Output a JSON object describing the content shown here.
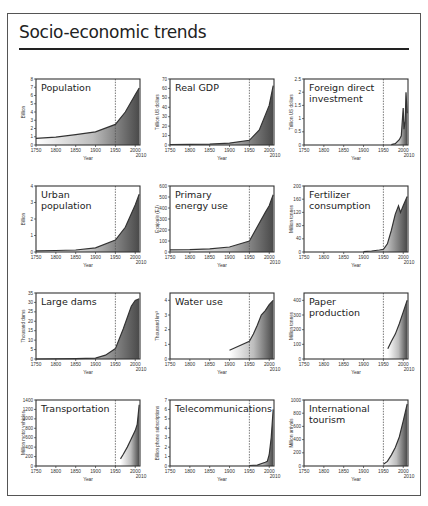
{
  "page": {
    "title": "Socio-economic trends",
    "xlabel": "Year",
    "x_ticks": [
      "1750",
      "1800",
      "1850",
      "1900",
      "1950",
      "2000"
    ],
    "x_end_label": "2010",
    "marker_year": 1950
  },
  "chart_data": [
    {
      "type": "area",
      "title": "Population",
      "ylabel": "Billion",
      "ylim": [
        0,
        8
      ],
      "yticks": [
        "0",
        "1",
        "2",
        "3",
        "4",
        "5",
        "6",
        "7",
        "8"
      ],
      "x": [
        1750,
        1800,
        1850,
        1900,
        1950,
        1975,
        2000,
        2010
      ],
      "values": [
        0.8,
        0.95,
        1.25,
        1.6,
        2.5,
        4.0,
        6.1,
        6.9
      ]
    },
    {
      "type": "area",
      "title": "Real GDP",
      "ylabel": "Trillion US dollars",
      "ylim": [
        0,
        70
      ],
      "yticks": [
        "0",
        "10",
        "20",
        "30",
        "40",
        "50",
        "60",
        "70"
      ],
      "x": [
        1750,
        1800,
        1850,
        1900,
        1950,
        1975,
        2000,
        2010
      ],
      "values": [
        0.5,
        0.7,
        1,
        2,
        5,
        16,
        42,
        63
      ]
    },
    {
      "type": "area",
      "title": "Foreign direct\ninvestment",
      "ylabel": "Trillion US dollars",
      "ylim": [
        0,
        2.5
      ],
      "yticks": [
        "0",
        "0.5",
        "1",
        "1.5",
        "2",
        "2.5"
      ],
      "x": [
        1970,
        1980,
        1990,
        1995,
        2000,
        2002,
        2005,
        2007,
        2008,
        2010
      ],
      "values": [
        0.01,
        0.05,
        0.2,
        0.35,
        1.4,
        0.6,
        0.9,
        2.0,
        1.7,
        1.2
      ]
    },
    {
      "type": "area",
      "title": "Urban\npopulation",
      "ylabel": "Billion",
      "ylim": [
        0,
        4
      ],
      "yticks": [
        "0",
        "1",
        "2",
        "3",
        "4"
      ],
      "x": [
        1750,
        1800,
        1850,
        1900,
        1950,
        1975,
        2000,
        2010
      ],
      "values": [
        0.07,
        0.09,
        0.12,
        0.25,
        0.73,
        1.5,
        2.85,
        3.5
      ]
    },
    {
      "type": "area",
      "title": "Primary\nenergy use",
      "ylabel": "Exajoule (EJ)",
      "ylim": [
        0,
        600
      ],
      "yticks": [
        "0",
        "100",
        "200",
        "300",
        "400",
        "500",
        "600"
      ],
      "x": [
        1750,
        1800,
        1850,
        1900,
        1950,
        1970,
        1990,
        2000,
        2010
      ],
      "values": [
        20,
        22,
        28,
        45,
        100,
        230,
        360,
        420,
        520
      ]
    },
    {
      "type": "area",
      "title": "Fertilizer\nconsumption",
      "ylabel": "Million tonnes",
      "ylim": [
        0,
        200
      ],
      "yticks": [
        "0",
        "40",
        "80",
        "120",
        "160",
        "200"
      ],
      "x": [
        1900,
        1920,
        1940,
        1950,
        1960,
        1970,
        1980,
        1988,
        1993,
        2000,
        2010
      ],
      "values": [
        1,
        3,
        6,
        8,
        25,
        65,
        115,
        140,
        120,
        140,
        168
      ]
    },
    {
      "type": "area",
      "title": "Large dams",
      "ylabel": "Thousand dams",
      "ylim": [
        0,
        35
      ],
      "yticks": [
        "0",
        "5",
        "10",
        "15",
        "20",
        "25",
        "30",
        "35"
      ],
      "x": [
        1750,
        1850,
        1900,
        1925,
        1950,
        1970,
        1990,
        2000,
        2010
      ],
      "values": [
        0,
        0.2,
        0.5,
        2,
        5.5,
        16,
        28,
        31,
        32
      ]
    },
    {
      "type": "area",
      "title": "Water use",
      "ylabel": "Thousand km³",
      "ylim": [
        0,
        4.5
      ],
      "yticks": [
        "0",
        "1",
        "2",
        "3",
        "4"
      ],
      "x": [
        1900,
        1950,
        1960,
        1970,
        1980,
        1990,
        2000,
        2010
      ],
      "values": [
        0.6,
        1.2,
        1.7,
        2.3,
        3.0,
        3.3,
        3.7,
        4.0
      ]
    },
    {
      "type": "area",
      "title": "Paper\nproduction",
      "ylabel": "Million tonnes",
      "ylim": [
        0,
        450
      ],
      "yticks": [
        "0",
        "100",
        "200",
        "300",
        "400"
      ],
      "x": [
        1961,
        1970,
        1980,
        1990,
        2000,
        2010
      ],
      "values": [
        70,
        120,
        170,
        240,
        320,
        400
      ]
    },
    {
      "type": "area",
      "title": "Transportation",
      "ylabel": "Million motor vehicles",
      "ylim": [
        0,
        1400
      ],
      "yticks": [
        "0",
        "200",
        "400",
        "600",
        "800",
        "1000",
        "1200",
        "1400"
      ],
      "x": [
        1963,
        1970,
        1980,
        1990,
        2000,
        2005,
        2010
      ],
      "values": [
        150,
        250,
        400,
        580,
        750,
        880,
        1300
      ]
    },
    {
      "type": "area",
      "title": "Telecommunications",
      "ylabel": "Billion phone subscriptions",
      "ylim": [
        0,
        7
      ],
      "yticks": [
        "0",
        "1",
        "2",
        "3",
        "4",
        "5",
        "6",
        "7"
      ],
      "x": [
        1950,
        1970,
        1990,
        1995,
        2000,
        2005,
        2010
      ],
      "values": [
        0.05,
        0.1,
        0.4,
        0.5,
        1.2,
        3.0,
        6.0
      ]
    },
    {
      "type": "area",
      "title": "International\ntourism",
      "ylabel": "Million arrivals",
      "ylim": [
        0,
        1000
      ],
      "yticks": [
        "0",
        "200",
        "400",
        "600",
        "800",
        "1000"
      ],
      "x": [
        1950,
        1960,
        1970,
        1980,
        1990,
        2000,
        2010
      ],
      "values": [
        25,
        70,
        165,
        280,
        440,
        680,
        940
      ]
    }
  ]
}
